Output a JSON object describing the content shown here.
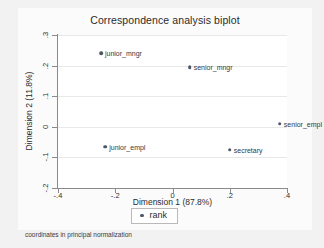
{
  "window": {
    "background_color": "#f2f2f2",
    "graph_region_color": "#fbfbfb",
    "plot_region_color": "#ffffff"
  },
  "footnote": "coordinates in principal normalization",
  "legend": {
    "label": "rank",
    "marker_icon": "filled-circle-marker",
    "position": "below-plot-center"
  },
  "chart_data": {
    "type": "scatter",
    "title": "Correspondence analysis biplot",
    "xlabel": "Dimension 1 (87.8%)",
    "ylabel": "Dimension 2 (11.8%)",
    "xlim": [
      -0.4,
      0.4
    ],
    "ylim": [
      -0.2,
      0.3
    ],
    "xticks": [
      -0.4,
      -0.2,
      0,
      0.2,
      0.4
    ],
    "xticklabels": [
      "-.4",
      "-.2",
      "0",
      ".2",
      ".4"
    ],
    "yticks": [
      0.3,
      0.2,
      0.1,
      0,
      -0.1,
      -0.2
    ],
    "yticklabels": [
      ".3",
      ".2",
      ".1",
      "0",
      "-.1",
      "-.2"
    ],
    "grid": "horizontal",
    "marker_color": "#4d5666",
    "series": [
      {
        "name": "rank",
        "points": [
          {
            "label": "junior_mngr",
            "x": -0.25,
            "y": 0.24,
            "label_side": "right"
          },
          {
            "label": "senior_mngr",
            "x": 0.06,
            "y": 0.195,
            "label_side": "right"
          },
          {
            "label": "senior_empl",
            "x": 0.375,
            "y": 0.01,
            "label_side": "right"
          },
          {
            "label": "junior_empl",
            "x": -0.235,
            "y": -0.065,
            "label_side": "right"
          },
          {
            "label": "secretary",
            "x": 0.2,
            "y": -0.075,
            "label_side": "right"
          }
        ]
      }
    ]
  }
}
